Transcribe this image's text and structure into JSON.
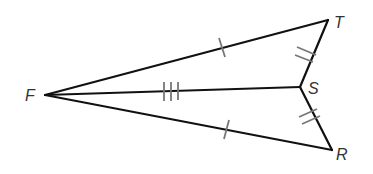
{
  "diagram": {
    "type": "geometry-figure",
    "points": {
      "F": {
        "label": "F",
        "x": 45,
        "y": 95
      },
      "T": {
        "label": "T",
        "x": 328,
        "y": 20
      },
      "S": {
        "label": "S",
        "x": 300,
        "y": 87
      },
      "R": {
        "label": "R",
        "x": 332,
        "y": 150
      }
    },
    "segments": [
      {
        "from": "F",
        "to": "T",
        "ticks": 1
      },
      {
        "from": "F",
        "to": "R",
        "ticks": 1
      },
      {
        "from": "F",
        "to": "S",
        "ticks": 3
      },
      {
        "from": "T",
        "to": "S",
        "ticks": 2
      },
      {
        "from": "S",
        "to": "R",
        "ticks": 2
      }
    ],
    "labels": {
      "F": "F",
      "T": "T",
      "S": "S",
      "R": "R"
    },
    "colors": {
      "line": "#111111",
      "tick": "#777777",
      "label": "#333333"
    }
  }
}
